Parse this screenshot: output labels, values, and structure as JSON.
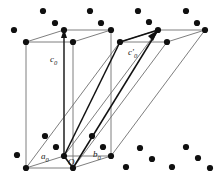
{
  "figure": {
    "name": "crystal-lattice-unit-cells",
    "type": "diagram",
    "width": 222,
    "height": 180,
    "background": "#ffffff",
    "colors": {
      "lattice_point": "#101010",
      "cell_edge_light": "#6f6f6f",
      "cell_edge_dark": "#111111",
      "label_text": "#1a1a1a"
    },
    "labels": [
      {
        "id": "c0",
        "text": "c",
        "sub": "0",
        "prime": "",
        "x": 50,
        "y": 55
      },
      {
        "id": "c0prime",
        "text": "c",
        "sub": "0",
        "prime": "'",
        "x": 128,
        "y": 48
      },
      {
        "id": "a0",
        "text": "a",
        "sub": "0",
        "prime": "",
        "x": 41,
        "y": 152
      },
      {
        "id": "b0",
        "text": "b",
        "sub": "0",
        "prime": "",
        "x": 93,
        "y": 150
      },
      {
        "id": "origin",
        "text": "O",
        "sub": "",
        "prime": "",
        "x": 68,
        "y": 158
      }
    ],
    "lattice_points": [
      {
        "x": 14,
        "y": 30
      },
      {
        "x": 43,
        "y": 11
      },
      {
        "x": 55,
        "y": 23
      },
      {
        "x": 90,
        "y": 11
      },
      {
        "x": 101,
        "y": 23
      },
      {
        "x": 138,
        "y": 11
      },
      {
        "x": 149,
        "y": 22
      },
      {
        "x": 186,
        "y": 11
      },
      {
        "x": 197,
        "y": 23
      },
      {
        "x": 45,
        "y": 136
      },
      {
        "x": 56,
        "y": 147
      },
      {
        "x": 17,
        "y": 155
      },
      {
        "x": 92,
        "y": 136
      },
      {
        "x": 103,
        "y": 147
      },
      {
        "x": 140,
        "y": 148
      },
      {
        "x": 152,
        "y": 159
      },
      {
        "x": 126,
        "y": 167
      },
      {
        "x": 186,
        "y": 147
      },
      {
        "x": 198,
        "y": 158
      },
      {
        "x": 172,
        "y": 167
      },
      {
        "x": 210,
        "y": 168
      }
    ],
    "vertices": {
      "ortho_cell": {
        "bottom_front_left": {
          "x": 26,
          "y": 168
        },
        "bottom_front_right": {
          "x": 73,
          "y": 168
        },
        "bottom_back_left": {
          "x": 64,
          "y": 156
        },
        "bottom_back_right": {
          "x": 111,
          "y": 156
        },
        "top_front_left": {
          "x": 26,
          "y": 42
        },
        "top_front_right": {
          "x": 73,
          "y": 42
        },
        "top_back_left": {
          "x": 64,
          "y": 30
        },
        "top_back_right": {
          "x": 111,
          "y": 30
        }
      },
      "sheared_cell": {
        "bottom_front_left": {
          "x": 26,
          "y": 168
        },
        "bottom_front_right": {
          "x": 73,
          "y": 168
        },
        "bottom_back_left": {
          "x": 64,
          "y": 156
        },
        "bottom_back_right": {
          "x": 111,
          "y": 156
        },
        "top_front_left": {
          "x": 120,
          "y": 42
        },
        "top_front_right": {
          "x": 167,
          "y": 42
        },
        "top_back_left": {
          "x": 158,
          "y": 30
        },
        "top_back_right": {
          "x": 205,
          "y": 30
        }
      }
    }
  }
}
